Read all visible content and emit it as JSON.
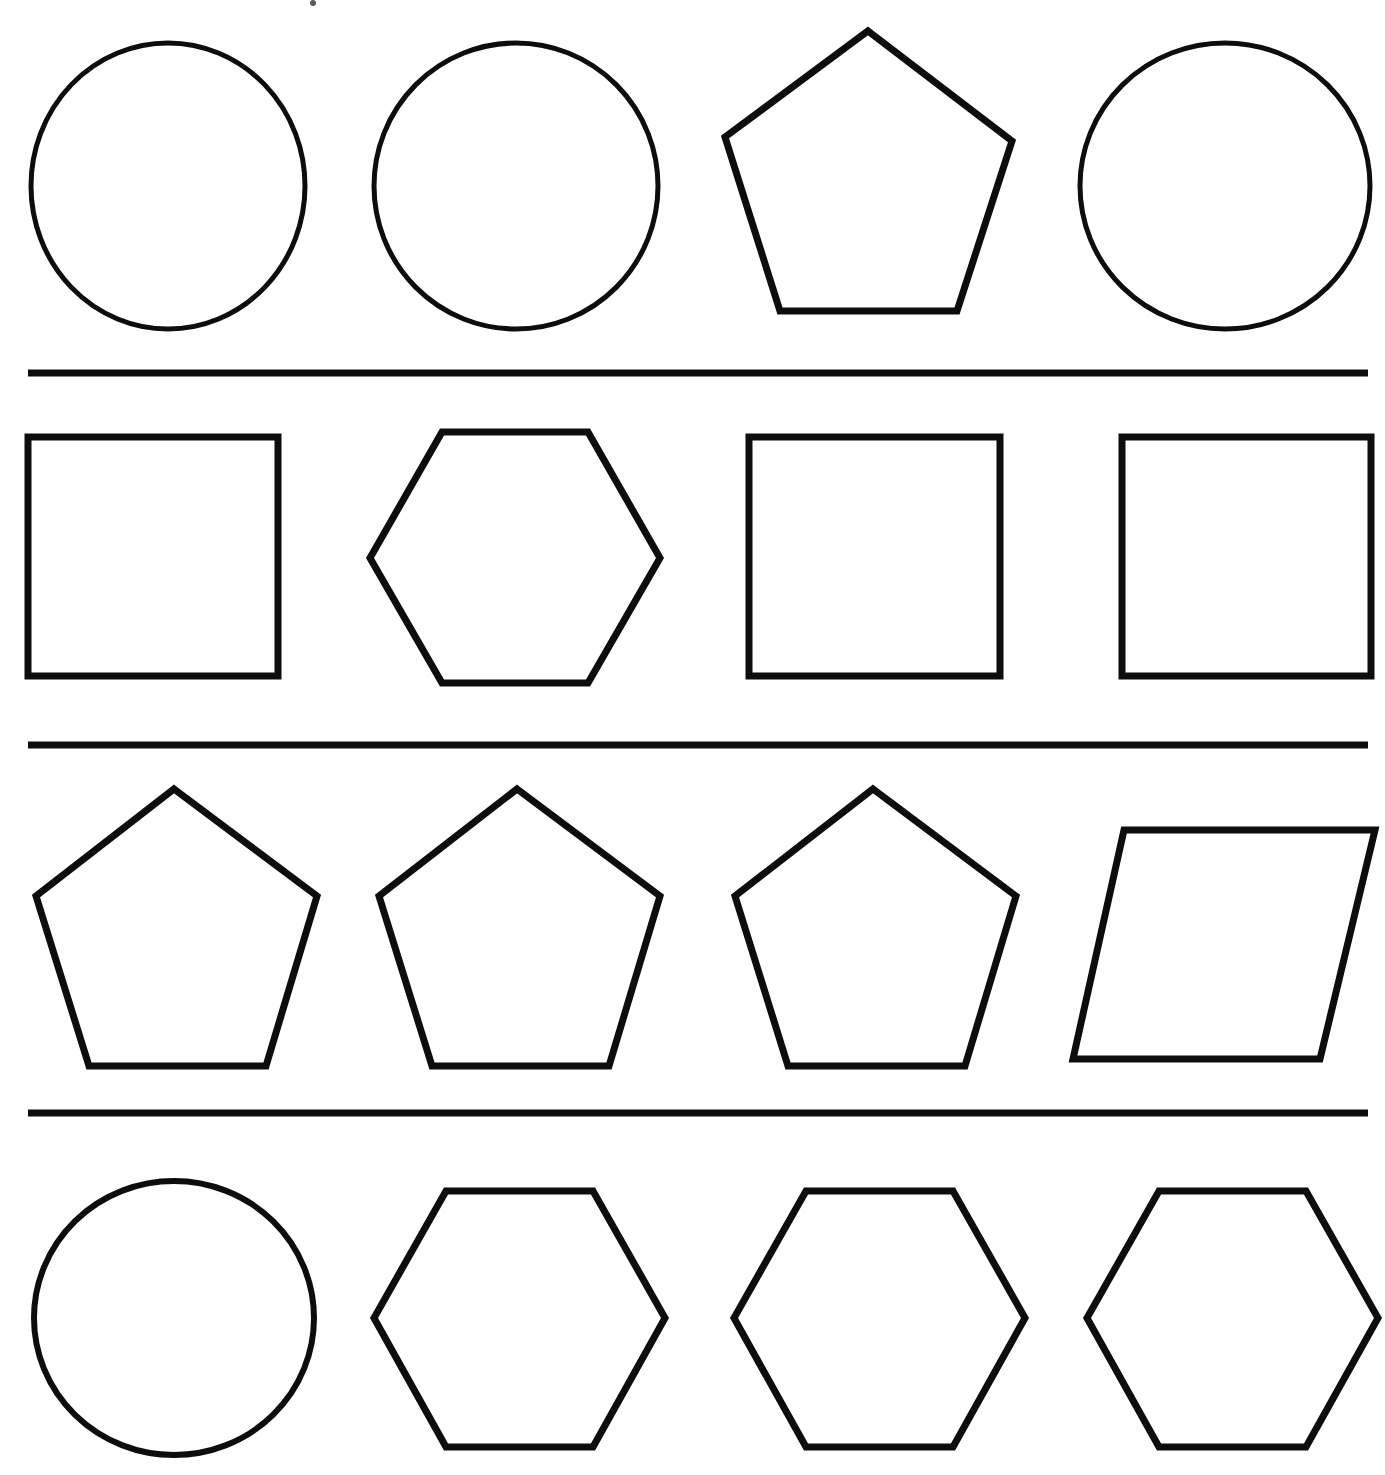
{
  "page": {
    "background_color": "#ffffff",
    "stroke_color": "#0d0d0d",
    "width": 1385,
    "height": 1475,
    "row_count": 4,
    "column_count": 4
  },
  "separators": [
    {
      "name": "separator-1",
      "x1": 28,
      "y1": 373,
      "x2": 1368,
      "y2": 373,
      "thickness": 7
    },
    {
      "name": "separator-2",
      "x1": 28,
      "y1": 745,
      "x2": 1368,
      "y2": 745,
      "thickness": 7
    },
    {
      "name": "separator-3",
      "x1": 28,
      "y1": 1113,
      "x2": 1368,
      "y2": 1113,
      "thickness": 7
    }
  ],
  "speck": {
    "name": "ink-speck",
    "cx": 313,
    "cy": 3,
    "r": 3
  },
  "rows": [
    {
      "index": 1,
      "label": "Row 1",
      "shapes": [
        {
          "name": "circle-r1-c1",
          "kind": "circle",
          "stroke_width": 5,
          "cx": 168,
          "cy": 186,
          "rx": 137,
          "ry": 143
        },
        {
          "name": "circle-r1-c2",
          "kind": "circle",
          "stroke_width": 5,
          "cx": 516,
          "cy": 186,
          "rx": 142,
          "ry": 143
        },
        {
          "name": "pentagon-r1-c3",
          "kind": "pentagon",
          "stroke_width": 7,
          "points": "868,31 1012,141 957,311 780,311 725,137"
        },
        {
          "name": "circle-r1-c4",
          "kind": "circle",
          "stroke_width": 5,
          "cx": 1225,
          "cy": 186,
          "rx": 145,
          "ry": 143
        }
      ]
    },
    {
      "index": 2,
      "label": "Row 2",
      "shapes": [
        {
          "name": "square-r2-c1",
          "kind": "square",
          "stroke_width": 7,
          "points": "28,437 278,437 278,676 28,676"
        },
        {
          "name": "hexagon-r2-c2",
          "kind": "hexagon",
          "stroke_width": 7,
          "points": "442,432 588,432 660,558 588,683 442,683 370,558"
        },
        {
          "name": "square-r2-c3",
          "kind": "square",
          "stroke_width": 7,
          "points": "749,437 1000,437 1000,676 749,676"
        },
        {
          "name": "square-r2-c4",
          "kind": "square",
          "stroke_width": 7,
          "points": "1122,437 1371,437 1371,676 1122,676"
        }
      ]
    },
    {
      "index": 3,
      "label": "Row 3",
      "shapes": [
        {
          "name": "pentagon-r3-c1",
          "kind": "pentagon",
          "stroke_width": 7,
          "points": "174,789 317,896 266,1066 89,1066 36,896"
        },
        {
          "name": "pentagon-r3-c2",
          "kind": "pentagon",
          "stroke_width": 7,
          "points": "517,789 660,896 609,1066 432,1066 379,896"
        },
        {
          "name": "pentagon-r3-c3",
          "kind": "pentagon",
          "stroke_width": 7,
          "points": "873,789 1016,896 965,1066 788,1066 735,896"
        },
        {
          "name": "parallelogram-r3-c4",
          "kind": "parallelogram",
          "stroke_width": 7,
          "points": "1124,830 1375,830 1320,1059 1073,1059"
        }
      ]
    },
    {
      "index": 4,
      "label": "Row 4",
      "shapes": [
        {
          "name": "circle-r4-c1",
          "kind": "circle",
          "stroke_width": 6,
          "cx": 174,
          "cy": 1318,
          "rx": 140,
          "ry": 137
        },
        {
          "name": "hexagon-r4-c2",
          "kind": "hexagon",
          "stroke_width": 7,
          "points": "446,1191 593,1191 665,1318 593,1447 446,1447 374,1318"
        },
        {
          "name": "hexagon-r4-c3",
          "kind": "hexagon",
          "stroke_width": 7,
          "points": "806,1191 953,1191 1025,1318 953,1447 806,1447 734,1318"
        },
        {
          "name": "hexagon-r4-c4",
          "kind": "hexagon",
          "stroke_width": 7,
          "points": "1159,1191 1306,1191 1378,1318 1306,1447 1159,1447 1087,1318"
        }
      ]
    }
  ],
  "chart_data": {
    "type": "table",
    "categories": [
      "Column 1",
      "Column 2",
      "Column 3",
      "Column 4"
    ],
    "rows": [
      {
        "name": "Row 1",
        "values": [
          "circle",
          "circle",
          "pentagon",
          "circle"
        ]
      },
      {
        "name": "Row 2",
        "values": [
          "square",
          "hexagon",
          "square",
          "square"
        ]
      },
      {
        "name": "Row 3",
        "values": [
          "pentagon",
          "pentagon",
          "pentagon",
          "parallelogram"
        ]
      },
      {
        "name": "Row 4",
        "values": [
          "circle",
          "hexagon",
          "hexagon",
          "hexagon"
        ]
      }
    ],
    "shape_counts": {
      "circle": 4,
      "square": 3,
      "pentagon": 4,
      "hexagon": 4,
      "parallelogram": 1
    },
    "xlabel": "",
    "ylabel": "",
    "grid": true,
    "legend": "none"
  }
}
